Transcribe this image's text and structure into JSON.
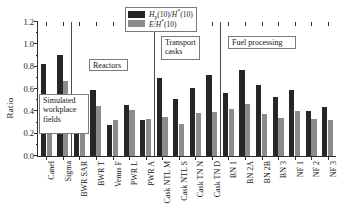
{
  "chart_data": {
    "type": "bar",
    "title": "",
    "xlabel": "",
    "ylabel": "Ratio",
    "ylim": [
      0.0,
      1.2
    ],
    "ytick_labels": [
      "0.0",
      "0.2",
      "0.4",
      "0.6",
      "0.8",
      "1.0",
      "1.2"
    ],
    "ytick_values": [
      0.0,
      0.2,
      0.4,
      0.6,
      0.8,
      1.0,
      1.2
    ],
    "grid": false,
    "legend_position": "top-center",
    "categories": [
      "Canel",
      "Sigma",
      "BWR SAR",
      "BWR T",
      "Venus F",
      "PWR L",
      "PWR A",
      "Cask NTL M",
      "Cask NTL S",
      "Cask TN N",
      "Cask TN D",
      "BN 1",
      "BN 2A",
      "BN 2B",
      "BN 3",
      "NF 1",
      "NF 2",
      "NF 3"
    ],
    "series": [
      {
        "name": "Hp(10)/H*(10)",
        "color": "#262626",
        "values": [
          0.825,
          0.905,
          0.21,
          0.595,
          0.275,
          0.46,
          0.32,
          0.695,
          0.515,
          0.605,
          0.725,
          0.56,
          0.77,
          0.635,
          0.53,
          0.59,
          0.405,
          0.44
        ]
      },
      {
        "name": "E/H*(10)",
        "color": "#8c8c8c",
        "values": [
          0.52,
          0.67,
          0.31,
          0.45,
          0.32,
          0.415,
          0.335,
          0.35,
          0.285,
          0.385,
          0.39,
          0.42,
          0.47,
          0.375,
          0.34,
          0.4,
          0.33,
          0.325
        ]
      }
    ],
    "annotations": [
      {
        "name": "simulated-workplace-fields",
        "text": "Simulated workplace fields"
      },
      {
        "name": "reactors",
        "text": "Reactors"
      },
      {
        "name": "transport-casks",
        "text": "Transport casks"
      },
      {
        "name": "fuel-processing",
        "text": "Fuel processing"
      }
    ],
    "group_separators": [
      2,
      7,
      11
    ]
  },
  "legend": {
    "series1": {
      "prefix": "H",
      "sub": "p",
      "mid": "(10)/",
      "sup_base": "H",
      "sup": "*",
      "suffix": "(10)"
    },
    "series2": {
      "prefix": "E",
      "mid": "/",
      "sup_base": "H",
      "sup": "*",
      "suffix": "(10)"
    },
    "series1_plain": "Hp(10)/H*(10)",
    "series2_plain": "E/H*(10)"
  },
  "groups": {
    "simulated": "Simulated workplace fields",
    "reactors": "Reactors",
    "casks": "Transport casks",
    "fuel": "Fuel processing"
  },
  "axis": {
    "y_title": "Ratio"
  }
}
